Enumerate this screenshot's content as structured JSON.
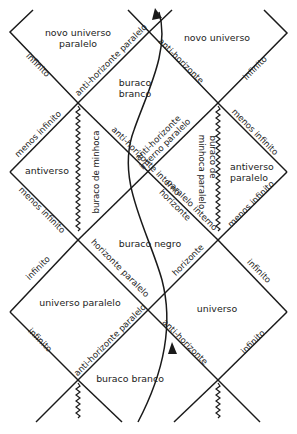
{
  "diagram": {
    "type": "penrose-diagram",
    "regions": {
      "novo_universo_paralelo": [
        "novo universo",
        "paralelo"
      ],
      "novo_universo": "novo universo",
      "buraco_branco_top": [
        "buraco",
        "branco"
      ],
      "antiverso": "antiverso",
      "antiverso_paralelo": [
        "antiverso",
        "paralelo"
      ],
      "buraco_negro": "buraco negro",
      "universo_paralelo": "universo paralelo",
      "universo": "universo",
      "buraco_branco_bottom": "buraco branco"
    },
    "edge_labels": {
      "infinito_top_left": "infinito",
      "anti_horizonte_paralelo_top": "anti-horizonte paralelo",
      "anti_horizonte_top_right": "anti-horizonte",
      "infinito_top_right": "infinito",
      "menos_infinito_left_upper": "menos infinito",
      "anti_horizonte_interno": "anti-horizonte interno",
      "anti_horizonte_interno_paralelo": [
        "anti-horizonte",
        "interno paralelo"
      ],
      "menos_infinito_right_upper": "menos infinito",
      "buraco_de_minhoca": "buraco de minhoca",
      "buraco_de_minhoca_paralelo": [
        "buraco de",
        "minhoca paralelo"
      ],
      "menos_infinito_left_lower": "menos infinito",
      "paralelo_interno": "paralelo interno",
      "horizonte_inner_left": "horizonte",
      "menos_infinito_right_lower": "menos infinito",
      "infinito_left_mid": "infinito",
      "horizonte_paralelo": "horizonte paralelo",
      "horizonte_right": "horizonte",
      "infinito_right_mid": "infinito",
      "infinito_left_low": "infinito",
      "anti_horizonte_paralelo_bottom": "anti-horizonte paralelo",
      "anti_horizonte_bottom": "anti-horizonte",
      "infinito_right_low": "infinito"
    },
    "colors": {
      "line": "#1a1a1a",
      "text": "#222222",
      "background": "#ffffff"
    }
  }
}
